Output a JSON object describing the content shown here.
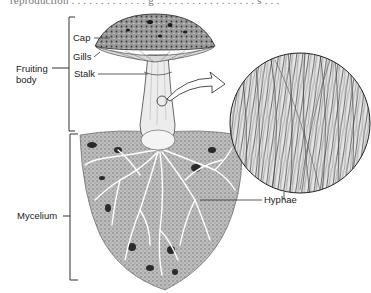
{
  "figure": {
    "top_cutoff_text": "reproduction . . . . . . . . . . . . .  g . . . . . . . . . . . . . . . . . s . . .",
    "labels": {
      "cap": "Cap",
      "gills": "Gills",
      "stalk": "Stalk",
      "fruiting_body_line1": "Fruiting",
      "fruiting_body_line2": "body",
      "mycelium": "Mycelium",
      "hyphae": "Hyphae"
    },
    "groups": {
      "fruiting_body": [
        "Cap",
        "Gills",
        "Stalk"
      ],
      "mycelium": [
        "Hyphae"
      ]
    },
    "colors": {
      "ink": "#1a1a1a",
      "mid_gray": "#8a8a8a",
      "light_gray": "#c8c8c8",
      "background": "#ffffff"
    }
  }
}
